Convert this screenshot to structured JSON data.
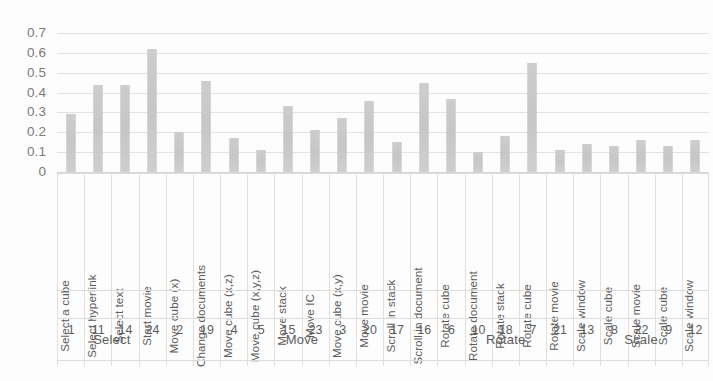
{
  "chart_data": {
    "type": "bar",
    "title": "",
    "subtitle": "",
    "xlabel": "",
    "ylabel": "",
    "ylim": [
      0,
      0.7
    ],
    "grid": true,
    "legend": false,
    "legend_position": "none",
    "bar_color": "#c9c9c9",
    "gridline_color": "#e2e2e2",
    "yticks": [
      "0.7",
      "0.6",
      "0.5",
      "0.4",
      "0.3",
      "0.2",
      "0.1",
      "0"
    ],
    "ytick_values": [
      0.7,
      0.6,
      0.5,
      0.4,
      0.3,
      0.2,
      0.1,
      0
    ],
    "categories": [
      "Select a cube",
      "Select hyperlink",
      "Select text",
      "Start movie",
      "Move cube (x)",
      "Change documents",
      "Move cube (x,z)",
      "Move cube (x,y,z)",
      "Move stack",
      "Move IC",
      "Move cube (x,y)",
      "Move movie",
      "Scroll in stack",
      "Scroll in document",
      "Rotate cube",
      "Rotate document",
      "Rotate stack",
      "Rotate cube",
      "Rotate movie",
      "Scale window",
      "Scale cube",
      "Scale movie",
      "Scale cube",
      "Scale window"
    ],
    "ids": [
      1,
      11,
      14,
      24,
      2,
      19,
      4,
      5,
      15,
      23,
      3,
      20,
      17,
      16,
      6,
      10,
      18,
      7,
      21,
      13,
      8,
      22,
      9,
      12
    ],
    "values": [
      0.29,
      0.44,
      0.44,
      0.62,
      0.2,
      0.46,
      0.17,
      0.11,
      0.33,
      0.21,
      0.27,
      0.36,
      0.15,
      0.45,
      0.37,
      0.1,
      0.18,
      0.55,
      0.11,
      0.14,
      0.13,
      0.16,
      0.13,
      0.16
    ],
    "groups": [
      {
        "label": "Select",
        "start": 0,
        "count": 4
      },
      {
        "label": "Move",
        "start": 4,
        "count": 10
      },
      {
        "label": "Rotate",
        "start": 14,
        "count": 5
      },
      {
        "label": "Scale",
        "start": 19,
        "count": 5
      }
    ]
  },
  "axis": {
    "y_max_label": "0.7",
    "y_min_label": "0"
  }
}
